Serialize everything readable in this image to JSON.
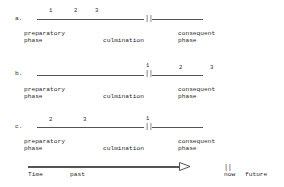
{
  "diagram": {
    "rows": [
      {
        "label": "a.",
        "markers": {
          "m1": "1",
          "m2": "2",
          "m3": "3"
        },
        "preparatory": [
          "preparatory",
          "phase"
        ],
        "culmination": "culmination",
        "consequent": [
          "consequent",
          "phase"
        ]
      },
      {
        "label": "b.",
        "markers": {
          "m1": "1",
          "m2": "2",
          "m3": "3"
        },
        "preparatory": [
          "preparatory",
          "phase"
        ],
        "culmination": "culmination",
        "consequent": [
          "consequent",
          "phase"
        ]
      },
      {
        "label": "c.",
        "markers": {
          "m1": "1",
          "m2": "2",
          "m3": "3"
        },
        "preparatory": [
          "preparatory",
          "phase"
        ],
        "culmination": "culmination",
        "consequent": [
          "consequent",
          "phase"
        ]
      }
    ],
    "boundary_symbol": "||",
    "timeline": {
      "time_label": "Time",
      "past_label": "past",
      "now_symbol": "||",
      "now_label": "now",
      "future_label": "future"
    }
  }
}
